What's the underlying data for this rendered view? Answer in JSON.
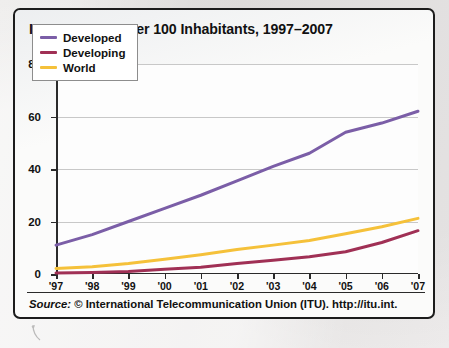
{
  "figure": {
    "title": "Internet Users Per 100 Inhabitants, 1997–2007",
    "source_label": "Source:",
    "source_text": " © International Telecommunication Union (ITU). http://itu.int.",
    "frame_color": "#1c1c1c",
    "background_color": "#fbfbfa"
  },
  "chart_data": {
    "type": "line",
    "title": "Internet Users Per 100 Inhabitants, 1997–2007",
    "xlabel": "",
    "ylabel": "",
    "categories": [
      "'97",
      "'98",
      "'99",
      "'00",
      "'01",
      "'02",
      "'03",
      "'04",
      "'05",
      "'06",
      "'07"
    ],
    "x": [
      1997,
      1998,
      1999,
      2000,
      2001,
      2002,
      2003,
      2004,
      2005,
      2006,
      2007
    ],
    "ylim": [
      0,
      80
    ],
    "yticks": [
      0,
      20,
      40,
      60,
      80
    ],
    "ytick_labels": [
      "0",
      "20",
      "40",
      "60",
      "80"
    ],
    "grid": "horizontal",
    "legend_position": "top-left",
    "series": [
      {
        "name": "Developed",
        "color": "#7B5EA7",
        "values": [
          11,
          15,
          20,
          25,
          30,
          35.5,
          41,
          46,
          54,
          57.5,
          62
        ]
      },
      {
        "name": "Developing",
        "color": "#A03055",
        "values": [
          0.4,
          0.6,
          1.0,
          1.8,
          2.6,
          4.0,
          5.2,
          6.6,
          8.5,
          12.0,
          16.5
        ]
      },
      {
        "name": "World",
        "color": "#F5C13A",
        "values": [
          2.1,
          2.8,
          4.0,
          5.6,
          7.3,
          9.3,
          11.0,
          12.8,
          15.3,
          18.0,
          21.2
        ]
      }
    ]
  },
  "icons": {
    "scan_arrow": "arrow-glyph"
  }
}
